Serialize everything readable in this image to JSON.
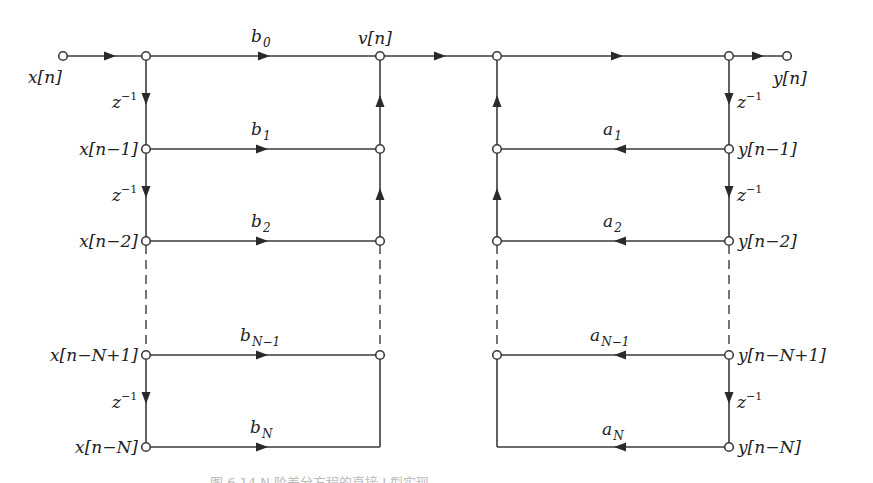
{
  "figure": {
    "type": "signal-flow-graph",
    "input_label": "x[n]",
    "output_label": "y[n]",
    "intermediate_label": "v[n]",
    "delay_label": "z",
    "delay_exponent": "−1",
    "feedforward": {
      "taps": [
        {
          "node": "x[n−1]",
          "coef_base": "b",
          "coef_sub": "1"
        },
        {
          "node": "x[n−2]",
          "coef_base": "b",
          "coef_sub": "2"
        },
        {
          "node": "x[n−N+1]",
          "coef_base": "b",
          "coef_sub": "N−1"
        },
        {
          "node": "x[n−N]",
          "coef_base": "b",
          "coef_sub": "N"
        }
      ],
      "b0_base": "b",
      "b0_sub": "0"
    },
    "feedback": {
      "taps": [
        {
          "node": "y[n−1]",
          "coef_base": "a",
          "coef_sub": "1"
        },
        {
          "node": "y[n−2]",
          "coef_base": "a",
          "coef_sub": "2"
        },
        {
          "node": "y[n−N+1]",
          "coef_base": "a",
          "coef_sub": "N−1"
        },
        {
          "node": "y[n−N]",
          "coef_base": "a",
          "coef_sub": "N"
        }
      ]
    },
    "caption": "图 6.14  N 阶差分方程的直接 I 型实现"
  },
  "colors": {
    "line": "#3a3a3a",
    "text": "#222222",
    "background": "#ffffff"
  }
}
